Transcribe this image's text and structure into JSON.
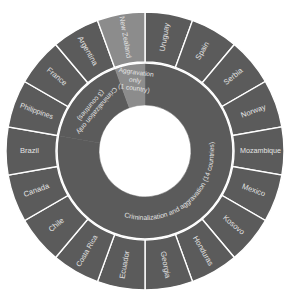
{
  "chart_data": {
    "type": "sunburst",
    "title": "",
    "center": [
      145,
      151
    ],
    "radii": {
      "inner": 46,
      "middle": 88,
      "outer": 139
    },
    "start_angle_deg": 0,
    "direction": "clockwise",
    "colors": {
      "dark": "#5b5b5b",
      "light": "#8c8c8c",
      "divider": "#ffffff",
      "text": "#e4e4e4"
    },
    "inner_ring": [
      {
        "label": "Criminalization and aggravation (14 countries)",
        "count": 14,
        "shade": "dark"
      },
      {
        "label": "Criminalization only (3 countries)",
        "count": 3,
        "shade": "dark"
      },
      {
        "label": "Aggravation only (1 country)",
        "count": 1,
        "shade": "light"
      }
    ],
    "outer_ring": [
      {
        "label": "Uruguay",
        "group": 0,
        "shade": "dark"
      },
      {
        "label": "Spain",
        "group": 0,
        "shade": "dark"
      },
      {
        "label": "Serbia",
        "group": 0,
        "shade": "dark"
      },
      {
        "label": "Norway",
        "group": 0,
        "shade": "dark"
      },
      {
        "label": "Mozambique",
        "group": 0,
        "shade": "dark"
      },
      {
        "label": "Mexico",
        "group": 0,
        "shade": "dark"
      },
      {
        "label": "Kosovo",
        "group": 0,
        "shade": "dark"
      },
      {
        "label": "Honduras",
        "group": 0,
        "shade": "dark"
      },
      {
        "label": "Georgia",
        "group": 0,
        "shade": "dark"
      },
      {
        "label": "Ecuador",
        "group": 0,
        "shade": "dark"
      },
      {
        "label": "Costa Rica",
        "group": 0,
        "shade": "dark"
      },
      {
        "label": "Chile",
        "group": 0,
        "shade": "dark"
      },
      {
        "label": "Canada",
        "group": 0,
        "shade": "dark"
      },
      {
        "label": "Brazil",
        "group": 0,
        "shade": "dark"
      },
      {
        "label": "Philippines",
        "group": 1,
        "shade": "dark"
      },
      {
        "label": "France",
        "group": 1,
        "shade": "dark"
      },
      {
        "label": "Argentina",
        "group": 1,
        "shade": "dark"
      },
      {
        "label": "New Zealand",
        "group": 2,
        "shade": "light"
      }
    ],
    "legend": null,
    "grid": false
  }
}
